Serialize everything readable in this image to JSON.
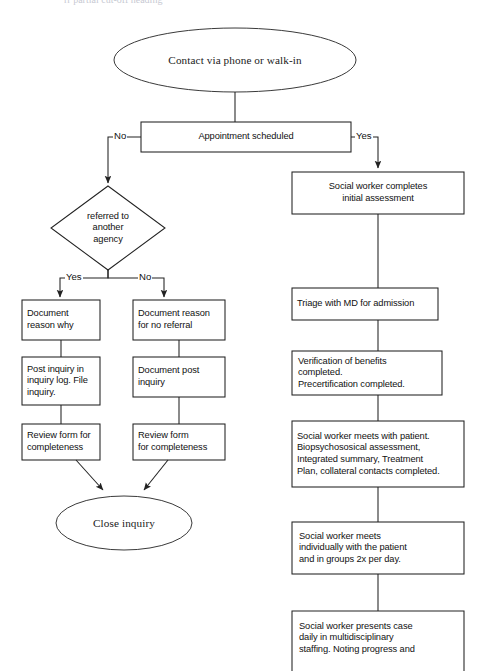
{
  "page": {
    "background_color": "#ffffff",
    "line_color": "#222222",
    "text_color": "#111111",
    "width": 483,
    "height": 671,
    "top_cut_text": "rr                                  partial cut-off heading"
  },
  "nodes": {
    "start": {
      "shape": "ellipse",
      "label": "Contact via phone or walk-in"
    },
    "appointment": {
      "shape": "rect",
      "label": "Appointment scheduled"
    },
    "decision_referral": {
      "shape": "diamond",
      "label": "referred to\nanother\nagency"
    },
    "document_reason_why": {
      "shape": "rect",
      "label": "Document\nreason why"
    },
    "post_inquiry_log": {
      "shape": "rect",
      "label": "Post inquiry in\ninquiry log.  File\ninquiry."
    },
    "review_form_left": {
      "shape": "rect",
      "label": "Review form for\ncompleteness"
    },
    "document_reason_no_referral": {
      "shape": "rect",
      "label": "Document reason\nfor no referral"
    },
    "document_post_inquiry": {
      "shape": "rect",
      "label": "Document post\ninquiry"
    },
    "review_form_middle": {
      "shape": "rect",
      "label": "Review form\nfor completeness"
    },
    "close_inquiry": {
      "shape": "ellipse",
      "label": "Close inquiry"
    },
    "initial_assessment": {
      "shape": "rect",
      "label": "Social worker completes\ninitial assessment"
    },
    "triage_md": {
      "shape": "rect",
      "label": "Triage with MD for admission"
    },
    "verification_benefits": {
      "shape": "rect",
      "label": "Verification of benefits\ncompleted.\nPrecertification completed."
    },
    "meets_with_patient": {
      "shape": "rect",
      "label": "Social worker meets with patient.\nBiopsychososical assessment,\nIntegrated summary, Treatment\nPlan, collateral contacts completed."
    },
    "meets_individually": {
      "shape": "rect",
      "label": "Social worker meets\nindividually with the patient\nand in groups 2x per day."
    },
    "presents_case": {
      "shape": "rect",
      "label": "Social worker presents case\ndaily in multidisciplinary\nstaffing. Noting progress and"
    }
  },
  "edge_labels": {
    "no_appointment": "No",
    "yes_appointment": "Yes",
    "yes_referral": "Yes",
    "no_referral": "No"
  }
}
